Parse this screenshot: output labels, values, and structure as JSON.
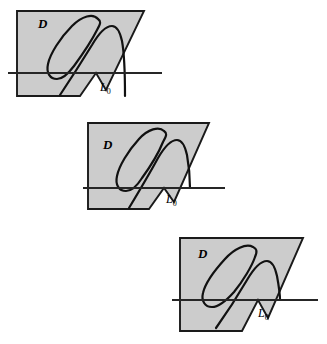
{
  "figure": {
    "caption_present": false,
    "background_color": "#ffffff",
    "region_fill_color": "#cccccc",
    "region_stroke_color": "#1a1a1a",
    "curve_color": "#111111",
    "axis_color": "#262626",
    "panel_count": 3,
    "panels": [
      {
        "id": "panel-top",
        "region_label": "D",
        "axis_label": "L",
        "axis_label_subscript": "0",
        "region_label_x": 38,
        "region_label_y": 28,
        "axis_label_x": 100,
        "axis_label_y": 91,
        "axis_y": 73,
        "axis_x_start": 8,
        "axis_x_end": 162,
        "region_points": "17,11 143,11 130,101 17,101",
        "description": "Gray quadrilateral D with tilted closed loop and arch crossing line L0"
      },
      {
        "id": "panel-middle",
        "region_label": "D",
        "axis_label": "L",
        "axis_label_subscript": "0",
        "region_label_x": 103,
        "region_label_y": 149,
        "axis_label_x": 166,
        "axis_label_y": 203,
        "axis_y": 188,
        "axis_x_start": 83,
        "axis_x_end": 225,
        "region_points": "88,123 208,123 196,213 88,213",
        "description": "Gray quadrilateral D with tilted closed loop and arch crossing line L0"
      },
      {
        "id": "panel-bottom",
        "region_label": "D",
        "axis_label": "L",
        "axis_label_subscript": "0",
        "region_label_x": 198,
        "region_label_y": 258,
        "axis_label_x": 258,
        "axis_label_y": 317,
        "axis_y": 300,
        "axis_x_start": 172,
        "axis_x_end": 318,
        "region_points": "180,238 302,238 290,330 180,330",
        "description": "Gray quadrilateral D with wide tilted loop and arch crossing line L0"
      }
    ]
  }
}
